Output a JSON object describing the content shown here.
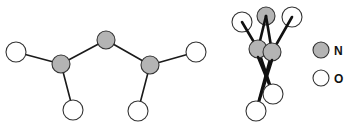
{
  "diagram": {
    "colors": {
      "nitrogen": "#b4b4b4",
      "oxygen": "#ffffff",
      "outline": "#333333",
      "bond": "#1a1a1a"
    },
    "left_molecule": {
      "atoms": [
        {
          "id": "O1",
          "element": "O",
          "x": 16,
          "y": 52,
          "r": 10
        },
        {
          "id": "N1",
          "element": "N",
          "x": 61,
          "y": 64,
          "r": 9
        },
        {
          "id": "N2",
          "element": "N",
          "x": 106,
          "y": 40,
          "r": 9
        },
        {
          "id": "N3",
          "element": "N",
          "x": 150,
          "y": 65,
          "r": 9
        },
        {
          "id": "O2",
          "element": "O",
          "x": 73,
          "y": 110,
          "r": 10
        },
        {
          "id": "O3",
          "element": "O",
          "x": 138,
          "y": 111,
          "r": 10
        },
        {
          "id": "O4",
          "element": "O",
          "x": 196,
          "y": 52,
          "r": 10
        }
      ],
      "bonds": [
        [
          "O1",
          "N1"
        ],
        [
          "N1",
          "N2"
        ],
        [
          "N2",
          "N3"
        ],
        [
          "N1",
          "O2"
        ],
        [
          "N3",
          "O3"
        ],
        [
          "N3",
          "O4"
        ]
      ]
    },
    "right_molecule": {
      "atoms": [
        {
          "id": "O1",
          "element": "O",
          "x": 242,
          "y": 22,
          "r": 10
        },
        {
          "id": "N2",
          "element": "N",
          "x": 266,
          "y": 16,
          "r": 9
        },
        {
          "id": "O4",
          "element": "O",
          "x": 292,
          "y": 17,
          "r": 10
        },
        {
          "id": "N1",
          "element": "N",
          "x": 258,
          "y": 49,
          "r": 9
        },
        {
          "id": "N3",
          "element": "N",
          "x": 272,
          "y": 52,
          "r": 9
        },
        {
          "id": "O3",
          "element": "O",
          "x": 273,
          "y": 94,
          "r": 10
        },
        {
          "id": "O2",
          "element": "O",
          "x": 256,
          "y": 111,
          "r": 10
        }
      ],
      "bonds": [
        [
          "O1",
          "N1"
        ],
        [
          "N2",
          "N1"
        ],
        [
          "N2",
          "N3"
        ],
        [
          "O4",
          "N3"
        ],
        [
          "N1",
          "O3"
        ],
        [
          "N3",
          "O2"
        ]
      ]
    },
    "legend": {
      "items": [
        {
          "label": "N",
          "element": "N",
          "x": 321,
          "y": 50,
          "r": 8
        },
        {
          "label": "O",
          "element": "O",
          "x": 321,
          "y": 78,
          "r": 8
        }
      ]
    }
  }
}
